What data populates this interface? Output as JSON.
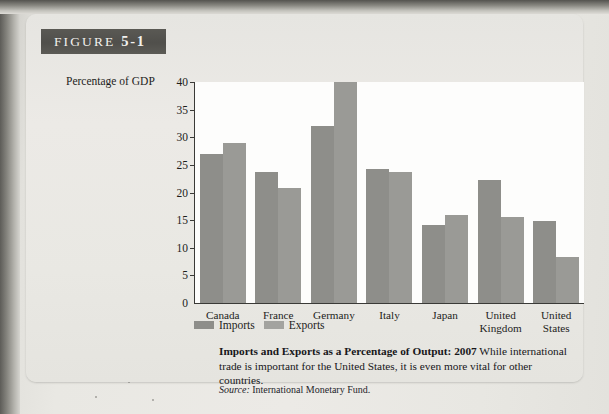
{
  "figure": {
    "tag_word": "FIGURE",
    "tag_number": "5-1"
  },
  "axis_title": "Percentage of GDP",
  "legend": {
    "imports_label": "Imports",
    "exports_label": "Exports",
    "imports_color": "#8e8e8a",
    "exports_color": "#a3a39f"
  },
  "caption": {
    "title": "Imports and Exports as a Percentage of Output: 2007",
    "body": "While international trade is important for the United States, it is even more vital for other countries.",
    "source_word": "Source:",
    "source_text": "International Monetary Fund."
  },
  "chart_data": {
    "type": "bar",
    "title": "Imports and Exports as a Percentage of Output: 2007",
    "xlabel": "",
    "ylabel": "Percentage of GDP",
    "ylim": [
      0,
      40
    ],
    "yticks": [
      0,
      5,
      10,
      15,
      20,
      25,
      30,
      35,
      40
    ],
    "ytick_labels": [
      "0",
      "5",
      "10",
      "15",
      "20",
      "25",
      "30",
      "35",
      "40"
    ],
    "grid": false,
    "legend_position": "below-axis-left",
    "categories": [
      "Canada",
      "France",
      "Germany",
      "Italy",
      "Japan",
      "United Kingdom",
      "United States"
    ],
    "category_lines": [
      [
        "Canada"
      ],
      [
        "France"
      ],
      [
        "Germany"
      ],
      [
        "Italy"
      ],
      [
        "Japan"
      ],
      [
        "United",
        "Kingdom"
      ],
      [
        "United",
        "States"
      ]
    ],
    "series": [
      {
        "name": "Imports",
        "color": "#8e8e8a",
        "values": [
          27,
          23.8,
          32,
          24.3,
          14.2,
          22.2,
          14.8
        ]
      },
      {
        "name": "Exports",
        "color": "#9a9a96",
        "values": [
          29,
          20.8,
          40,
          23.7,
          16,
          15.6,
          8.4
        ]
      }
    ]
  }
}
